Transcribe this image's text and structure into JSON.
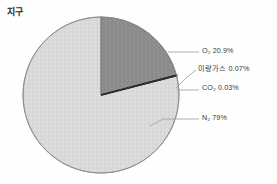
{
  "chart": {
    "title": "지구",
    "title_meaning": "Earth"
  },
  "chart_data": {
    "type": "pie",
    "title": "지구",
    "categories": [
      "O₂",
      "미량가스",
      "CO₂",
      "N₂"
    ],
    "values": [
      20.9,
      0.07,
      0.03,
      79.0
    ],
    "unit": "%",
    "labels": [
      "O₂ 20.9%",
      "미량가스 0.07%",
      "CO₂ 0.03%",
      "N₂ 79%"
    ],
    "colors": [
      "#8d8d8d",
      "#1c1c1c",
      "#2e2e2e",
      "#d9d9d9"
    ],
    "legend_position": "right-callouts",
    "grid": false,
    "start_angle_deg": -90,
    "direction": "clockwise"
  },
  "slices": {
    "o2": {
      "name": "O₂",
      "label": "O₂ 20.9%",
      "value": 20.9,
      "color": "#8d8d8d"
    },
    "trace": {
      "name": "미량가스",
      "label": "미량가스 0.07%",
      "value": 0.07,
      "color": "#1c1c1c"
    },
    "co2": {
      "name": "CO₂",
      "label": "CO₂ 0.03%",
      "value": 0.03,
      "color": "#2e2e2e"
    },
    "n2": {
      "name": "N₂",
      "label": "N₂ 79%",
      "value": 79.0,
      "color": "#d9d9d9"
    }
  },
  "geometry": {
    "center_x": 101,
    "center_y": 95,
    "radius": 78
  },
  "style": {
    "outline_color": "#8a8a8a",
    "leader_color": "#9a9a9a",
    "background": "#fefefe"
  }
}
